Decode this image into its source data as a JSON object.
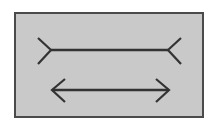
{
  "figure": {
    "name": "Muller-Lyer illusion",
    "panel": {
      "background_color": "#c9c9c9",
      "border_color": "#4a4a4a",
      "border_width": 2,
      "x": 14,
      "y": 12,
      "width": 190,
      "height": 106
    },
    "page_background_color": "#ffffff",
    "stroke_color": "#333333",
    "stroke_width": 2.2,
    "shafts": [
      {
        "id": "top-shaft",
        "label": "upper line segment",
        "x1": 35,
        "y1": 36,
        "x2": 152,
        "y2": 36,
        "length": 117
      },
      {
        "id": "bottom-shaft",
        "label": "lower line segment",
        "x1": 36,
        "y1": 76,
        "x2": 153,
        "y2": 76,
        "length": 117
      }
    ],
    "fins": [
      {
        "id": "top-left-fin",
        "label": "upper left outward fin",
        "direction": "outward",
        "glyph": ">",
        "points": "22,24 35,36 22,50"
      },
      {
        "id": "top-right-fin",
        "label": "upper right outward fin",
        "direction": "outward",
        "glyph": "<",
        "points": "165,24 152,36 165,50"
      },
      {
        "id": "bottom-left-arrowhead",
        "label": "lower left arrowhead",
        "direction": "inward",
        "glyph": "<",
        "points": "49,65 36,76 49,88"
      },
      {
        "id": "bottom-right-arrowhead",
        "label": "lower right arrowhead",
        "direction": "inward",
        "glyph": ">",
        "points": "140,65 153,76 140,88"
      }
    ]
  }
}
